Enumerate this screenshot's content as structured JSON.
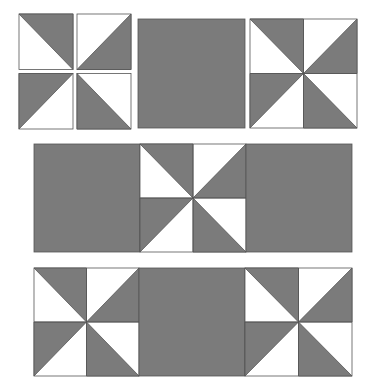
{
  "diagram": {
    "colors": {
      "fill": "#7b7b7b",
      "background": "#ffffff",
      "stroke": "#555555"
    },
    "rows": [
      {
        "name": "row-1-units",
        "pieces": [
          {
            "type": "four-patch-separated",
            "label": "half-square-triangle units",
            "x": 19,
            "y": 14,
            "w": 112,
            "h": 115
          },
          {
            "type": "solid",
            "label": "solid square",
            "x": 138,
            "y": 19,
            "w": 107,
            "h": 109
          },
          {
            "type": "pinwheel",
            "label": "pinwheel block",
            "x": 250,
            "y": 19,
            "w": 107,
            "h": 109
          }
        ]
      },
      {
        "name": "row-2-solid-pinwheel-solid",
        "pieces": [
          {
            "type": "solid",
            "label": "solid square",
            "x": 34,
            "y": 144,
            "w": 106,
            "h": 108
          },
          {
            "type": "pinwheel",
            "label": "pinwheel block",
            "x": 140,
            "y": 144,
            "w": 106,
            "h": 108
          },
          {
            "type": "solid",
            "label": "solid square",
            "x": 246,
            "y": 144,
            "w": 106,
            "h": 108
          }
        ]
      },
      {
        "name": "row-3-pinwheel-solid-pinwheel",
        "pieces": [
          {
            "type": "pinwheel",
            "label": "pinwheel block",
            "x": 34,
            "y": 268,
            "w": 105,
            "h": 108
          },
          {
            "type": "solid",
            "label": "solid square",
            "x": 139,
            "y": 268,
            "w": 106,
            "h": 108
          },
          {
            "type": "pinwheel",
            "label": "pinwheel block",
            "x": 245,
            "y": 268,
            "w": 107,
            "h": 108
          }
        ]
      }
    ]
  }
}
